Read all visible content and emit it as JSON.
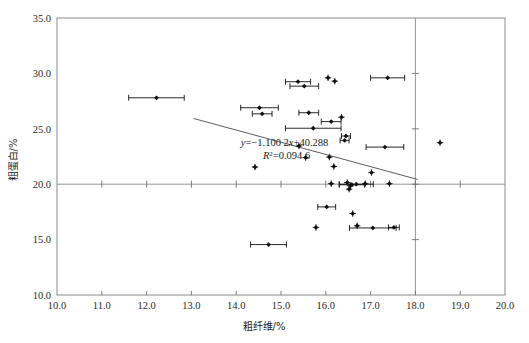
{
  "chart_data": {
    "type": "scatter",
    "title": "",
    "xlabel": "粗纤维/%",
    "ylabel": "粗蛋白/%",
    "xlim": [
      10.0,
      20.0
    ],
    "ylim": [
      10.0,
      35.0
    ],
    "xticks": [
      "10.0",
      "11.0",
      "12.0",
      "13.0",
      "14.0",
      "15.0",
      "16.0",
      "17.0",
      "18.0",
      "19.0",
      "20.0"
    ],
    "yticks": [
      "10.0",
      "15.0",
      "20.0",
      "25.0",
      "30.0",
      "35.0"
    ],
    "xtick_values": [
      10.0,
      11.0,
      12.0,
      13.0,
      14.0,
      15.0,
      16.0,
      17.0,
      18.0,
      19.0,
      20.0
    ],
    "ytick_values": [
      10.0,
      15.0,
      20.0,
      25.0,
      30.0,
      35.0
    ],
    "grid": false,
    "reference_lines": {
      "vertical_x": 18.0,
      "horizontal_y": 20.0
    },
    "annotations": {
      "equation": "y=-1.100 2x+40.288",
      "r_squared": "R2=0.094 6",
      "r_squared_display": "R²=0.094 6",
      "equation_x": 15.08,
      "equation_y": 23.45
    },
    "fit": {
      "slope": -1.1002,
      "intercept": 40.288,
      "r2": 0.0946,
      "x_start": 13.05,
      "x_end": 18.05
    },
    "legend": "",
    "legend_position": "none",
    "marker_style": "filled-diamond",
    "error_bar_direction": "horizontal",
    "points": [
      {
        "x": 12.22,
        "y": 27.8,
        "xerr": 0.62
      },
      {
        "x": 14.52,
        "y": 26.9,
        "xerr": 0.42
      },
      {
        "x": 14.58,
        "y": 26.35,
        "xerr": 0.22
      },
      {
        "x": 14.42,
        "y": 21.55,
        "xerr": 0.0
      },
      {
        "x": 14.72,
        "y": 14.55,
        "xerr": 0.4
      },
      {
        "x": 15.38,
        "y": 29.25,
        "xerr": 0.28
      },
      {
        "x": 15.52,
        "y": 28.85,
        "xerr": 0.32
      },
      {
        "x": 15.4,
        "y": 23.45,
        "xerr": 0.0
      },
      {
        "x": 15.55,
        "y": 22.4,
        "xerr": 0.0
      },
      {
        "x": 15.62,
        "y": 26.45,
        "xerr": 0.22
      },
      {
        "x": 15.72,
        "y": 25.05,
        "xerr": 0.62
      },
      {
        "x": 15.78,
        "y": 16.1,
        "xerr": 0.0
      },
      {
        "x": 16.05,
        "y": 29.6,
        "xerr": 0.0
      },
      {
        "x": 16.12,
        "y": 25.65,
        "xerr": 0.22
      },
      {
        "x": 16.08,
        "y": 22.45,
        "xerr": 0.0
      },
      {
        "x": 16.18,
        "y": 21.6,
        "xerr": 0.0
      },
      {
        "x": 16.12,
        "y": 20.05,
        "xerr": 0.0
      },
      {
        "x": 16.02,
        "y": 17.95,
        "xerr": 0.2
      },
      {
        "x": 16.2,
        "y": 29.3,
        "xerr": 0.0
      },
      {
        "x": 16.35,
        "y": 26.05,
        "xerr": 0.0
      },
      {
        "x": 16.45,
        "y": 24.35,
        "xerr": 0.1
      },
      {
        "x": 16.42,
        "y": 23.95,
        "xerr": 0.1
      },
      {
        "x": 16.48,
        "y": 20.15,
        "xerr": 0.0
      },
      {
        "x": 16.55,
        "y": 19.85,
        "xerr": 0.0
      },
      {
        "x": 16.52,
        "y": 19.55,
        "xerr": 0.0
      },
      {
        "x": 16.58,
        "y": 19.95,
        "xerr": 0.28
      },
      {
        "x": 16.6,
        "y": 17.35,
        "xerr": 0.0
      },
      {
        "x": 16.68,
        "y": 20.0,
        "xerr": 0.38
      },
      {
        "x": 16.7,
        "y": 16.25,
        "xerr": 0.0
      },
      {
        "x": 16.88,
        "y": 20.05,
        "xerr": 0.0
      },
      {
        "x": 17.02,
        "y": 21.05,
        "xerr": 0.0
      },
      {
        "x": 17.05,
        "y": 16.05,
        "xerr": 0.52
      },
      {
        "x": 17.32,
        "y": 23.35,
        "xerr": 0.42
      },
      {
        "x": 17.38,
        "y": 29.6,
        "xerr": 0.38
      },
      {
        "x": 17.42,
        "y": 20.05,
        "xerr": 0.0
      },
      {
        "x": 17.52,
        "y": 16.1,
        "xerr": 0.12
      },
      {
        "x": 18.55,
        "y": 23.75,
        "xerr": 0.0
      }
    ]
  }
}
